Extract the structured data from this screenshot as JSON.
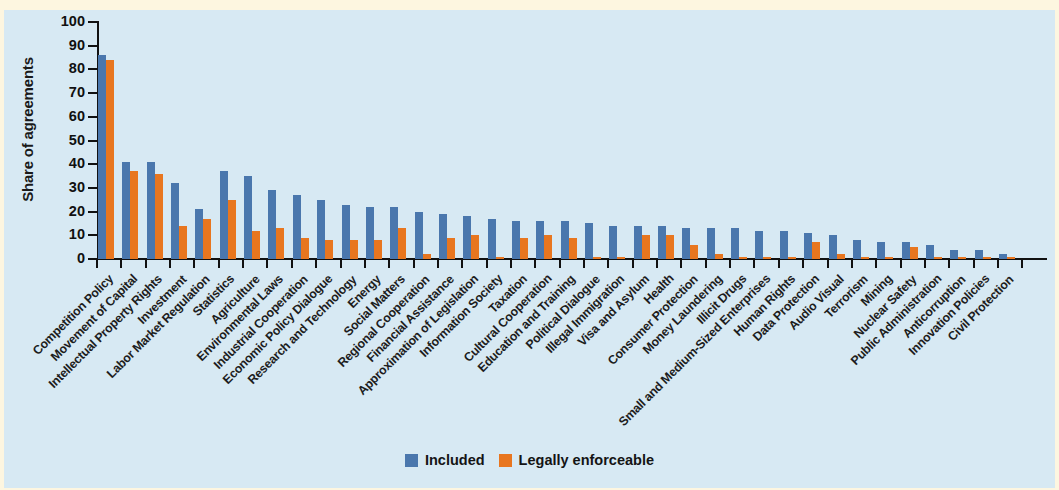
{
  "chart_data": {
    "type": "bar",
    "title": "",
    "subtitle": "",
    "xlabel": "",
    "ylabel": "Share of agreements",
    "ylim": [
      0,
      100
    ],
    "yticks": [
      0,
      10,
      20,
      30,
      40,
      50,
      60,
      70,
      80,
      90,
      100
    ],
    "grid": false,
    "legend_position": "bottom-center",
    "colors": {
      "included": "#4a77ad",
      "legally_enforceable": "#e8761f",
      "background": "#d7e9f3",
      "page": "#fdf6e0",
      "axis": "#111111"
    },
    "categories": [
      "Competition Policy",
      "Movement of Capital",
      "Intellectual Property Rights",
      "Investment",
      "Labor Market Regulation",
      "Statistics",
      "Agriculture",
      "Environmental Laws",
      "Industrial Cooperation",
      "Economic Policy Dialogue",
      "Research and Technology",
      "Energy",
      "Social Matters",
      "Regional Cooperation",
      "Financial Assistance",
      "Approximation of Legislation",
      "Information Society",
      "Taxation",
      "Cultural Cooperation",
      "Education and Training",
      "Political Dialogue",
      "Illegal Immigration",
      "Visa and Asylum",
      "Health",
      "Consumer Protection",
      "Money Laundering",
      "Illicit Drugs",
      "Small and Medium-Sized Enterprises",
      "Human Rights",
      "Data Protection",
      "Audio Visual",
      "Terrorism",
      "Mining",
      "Nuclear Safety",
      "Public Administration",
      "Anticorruption",
      "Innovation Policies",
      "Civil Protection"
    ],
    "series": [
      {
        "name": "Included",
        "color": "#4a77ad",
        "values": [
          86,
          41,
          41,
          32,
          21,
          37,
          35,
          29,
          27,
          25,
          23,
          22,
          22,
          20,
          19,
          18,
          17,
          16,
          16,
          16,
          15,
          14,
          14,
          14,
          13,
          13,
          13,
          12,
          12,
          11,
          10,
          8,
          7,
          7,
          6,
          4,
          4,
          2
        ]
      },
      {
        "name": "Legally enforceable",
        "color": "#e8761f",
        "values": [
          84,
          37,
          36,
          14,
          17,
          25,
          12,
          13,
          9,
          8,
          8,
          8,
          13,
          2,
          9,
          10,
          1,
          9,
          10,
          9,
          1,
          1,
          10,
          10,
          6,
          2,
          1,
          1,
          1,
          7,
          2,
          1,
          1,
          5,
          1,
          1,
          1,
          1
        ]
      }
    ]
  },
  "legend": {
    "items": [
      {
        "label": "Included",
        "color": "#4a77ad"
      },
      {
        "label": "Legally enforceable",
        "color": "#e8761f"
      }
    ]
  }
}
